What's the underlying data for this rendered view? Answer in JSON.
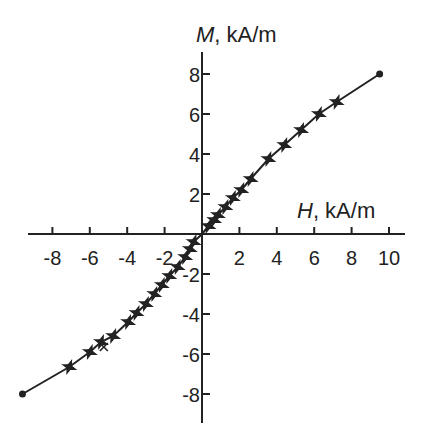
{
  "chart_data": {
    "type": "line",
    "title": "",
    "xlabel": "H, kA/m",
    "xlabel_var": "H",
    "xlabel_unit": ", kA/m",
    "ylabel": "M, kA/m",
    "ylabel_var": "M",
    "ylabel_unit": ", kA/m",
    "xlim": [
      -9.6,
      10.8
    ],
    "ylim": [
      -9.5,
      9.1
    ],
    "x_ticks": [
      -8,
      -6,
      -4,
      -2,
      2,
      4,
      6,
      8,
      10
    ],
    "y_ticks": [
      -8,
      -6,
      -4,
      -2,
      2,
      4,
      6,
      8
    ],
    "x_tick_labels": [
      "-8",
      "-6",
      "-4",
      "-2",
      "2",
      "4",
      "6",
      "8",
      "10"
    ],
    "y_tick_labels": [
      "-8",
      "-6",
      "-4",
      "-2",
      "2",
      "4",
      "6",
      "8"
    ],
    "grid": false,
    "legend": null,
    "axes_style": "cross-through-origin",
    "series": [
      {
        "name": "magnetization curve",
        "style": "line",
        "color": "#222222",
        "x": [
          -9.6,
          -7.1,
          -6.0,
          -5.4,
          -4.75,
          -3.95,
          -3.5,
          -3.0,
          -2.55,
          -2.15,
          -1.75,
          -1.3,
          -0.9,
          -0.65,
          -0.45,
          0,
          0.35,
          0.65,
          0.85,
          1.25,
          1.65,
          2.1,
          2.6,
          3.55,
          4.4,
          5.3,
          6.25,
          7.2,
          9.5
        ],
        "y": [
          -8.0,
          -6.65,
          -5.9,
          -5.4,
          -5.1,
          -4.4,
          -3.95,
          -3.5,
          -3.0,
          -2.55,
          -2.1,
          -1.65,
          -1.15,
          -0.75,
          -0.4,
          0,
          0.4,
          0.7,
          0.95,
          1.35,
          1.8,
          2.2,
          2.75,
          3.75,
          4.45,
          5.2,
          6.0,
          6.6,
          8.0
        ]
      },
      {
        "name": "measured points (star markers)",
        "style": "markers",
        "marker": "star",
        "x": [
          -7.1,
          -6.0,
          -5.4,
          -4.75,
          -3.95,
          -3.5,
          -3.0,
          -2.55,
          -2.15,
          -1.75,
          -1.3,
          -0.9,
          -0.65,
          -0.45,
          0.35,
          0.65,
          0.85,
          1.25,
          1.65,
          2.1,
          2.6,
          3.55,
          4.4,
          5.3,
          6.25,
          7.2
        ],
        "y": [
          -6.65,
          -5.9,
          -5.4,
          -5.1,
          -4.4,
          -3.95,
          -3.5,
          -3.0,
          -2.55,
          -2.1,
          -1.65,
          -1.15,
          -0.75,
          -0.4,
          0.4,
          0.7,
          0.95,
          1.35,
          1.8,
          2.2,
          2.75,
          3.75,
          4.45,
          5.2,
          6.0,
          6.6
        ]
      },
      {
        "name": "extra point (x marker)",
        "style": "markers",
        "marker": "x",
        "x": [
          -5.25
        ],
        "y": [
          -5.65
        ]
      },
      {
        "name": "end points",
        "style": "markers",
        "marker": "dot",
        "x": [
          -9.6,
          9.5
        ],
        "y": [
          -8.0,
          8.0
        ]
      }
    ]
  },
  "layout": {
    "origin_px": [
      202,
      234
    ],
    "x_px_per_unit": 18.7,
    "y_px_per_unit": 20,
    "x_axis_range_px": [
      28,
      405
    ],
    "y_axis_range_px": [
      52,
      423
    ]
  }
}
